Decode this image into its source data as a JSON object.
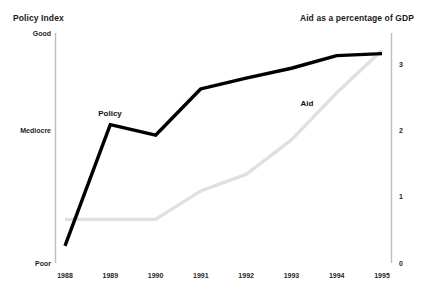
{
  "header": {
    "left_title": "Policy Index",
    "right_title": "Aid as a percentage of GDP"
  },
  "footnote": "",
  "axes": {
    "left_ticks": [
      "Good",
      "Mediocre",
      "Poor"
    ],
    "right_ticks": [
      "3",
      "2",
      "1",
      "0"
    ],
    "x_ticks": [
      "1988",
      "1989",
      "1990",
      "1991",
      "1992",
      "1993",
      "1994",
      "1995"
    ]
  },
  "series_labels": {
    "policy": "Policy",
    "aid": "Aid"
  },
  "colors": {
    "policy_line": "#000000",
    "aid_line": "#e0e0e0",
    "axis": "#bdbdbd",
    "text": "#1a1a1a"
  },
  "chart_data": {
    "type": "line",
    "title": "Policy Index",
    "subtitle": "Aid as a percentage of GDP",
    "xlabel": "",
    "ylabel": "Policy Index",
    "y2label": "Aid as a percentage of GDP",
    "x": [
      "1988",
      "1989",
      "1990",
      "1991",
      "1992",
      "1993",
      "1994",
      "1995"
    ],
    "categories": [
      "1988",
      "1989",
      "1990",
      "1991",
      "1992",
      "1993",
      "1994",
      "1995"
    ],
    "ylim": [
      0,
      3.45
    ],
    "y2lim": [
      0,
      3.45
    ],
    "y_tick_labels": [
      "Poor",
      "Mediocre",
      "Good"
    ],
    "y_tick_values": [
      0,
      2,
      3.45
    ],
    "y2_tick_labels": [
      "0",
      "1",
      "2",
      "3"
    ],
    "y2_tick_values": [
      0,
      1,
      2,
      3
    ],
    "grid": false,
    "legend": "inline-annotations",
    "series": [
      {
        "name": "Policy",
        "color": "#000000",
        "values": [
          0.25,
          2.08,
          1.92,
          2.62,
          2.78,
          2.93,
          3.12,
          3.15
        ]
      },
      {
        "name": "Aid",
        "color": "#e0e0e0",
        "values": [
          0.65,
          0.65,
          0.65,
          1.08,
          1.33,
          1.85,
          2.56,
          3.2
        ]
      }
    ],
    "annotations": [
      {
        "text": "Policy",
        "x": "1989",
        "y": 2.45
      },
      {
        "text": "Aid",
        "x": "1993",
        "y": 2.4
      }
    ]
  }
}
